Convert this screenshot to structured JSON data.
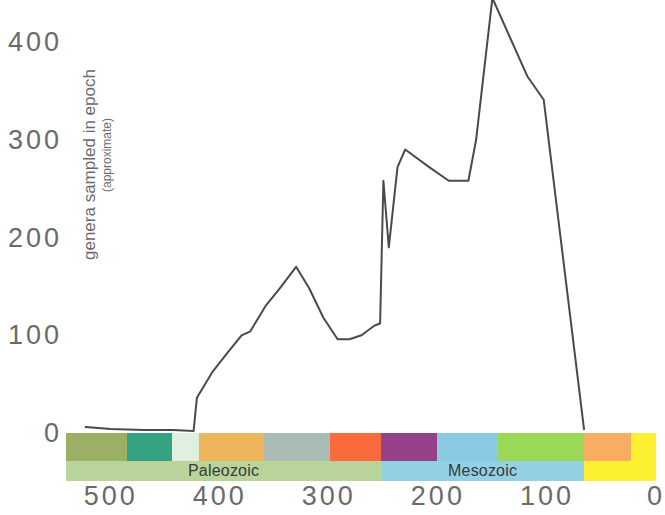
{
  "chart_data": {
    "type": "line",
    "title": "",
    "xlabel": "",
    "ylabel": "genera sampled in epoch",
    "ylabel_sub": "(approximate)",
    "xlim": [
      541,
      0
    ],
    "ylim": [
      0,
      460
    ],
    "x_reversed": true,
    "grid": false,
    "legend": null,
    "line_color": "#4a4a4a",
    "x_ticks": [
      {
        "value": 500,
        "label": "500"
      },
      {
        "value": 400,
        "label": "400"
      },
      {
        "value": 300,
        "label": "300"
      },
      {
        "value": 200,
        "label": "200"
      },
      {
        "value": 100,
        "label": "100"
      },
      {
        "value": 0,
        "label": "0"
      }
    ],
    "y_ticks": [
      {
        "value": 0,
        "label": "0"
      },
      {
        "value": 100,
        "label": "100"
      },
      {
        "value": 200,
        "label": "200"
      },
      {
        "value": 300,
        "label": "300"
      },
      {
        "value": 400,
        "label": "400"
      }
    ],
    "series": [
      {
        "name": "genera sampled in epoch",
        "points": [
          [
            523,
            6
          ],
          [
            500,
            4
          ],
          [
            470,
            3
          ],
          [
            443,
            3
          ],
          [
            424,
            2
          ],
          [
            421,
            36
          ],
          [
            407,
            62
          ],
          [
            393,
            82
          ],
          [
            380,
            100
          ],
          [
            372,
            104
          ],
          [
            358,
            130
          ],
          [
            345,
            148
          ],
          [
            330,
            170
          ],
          [
            318,
            148
          ],
          [
            305,
            118
          ],
          [
            292,
            96
          ],
          [
            281,
            96
          ],
          [
            270,
            100
          ],
          [
            258,
            110
          ],
          [
            253,
            112
          ],
          [
            250,
            258
          ],
          [
            245,
            190
          ],
          [
            237,
            272
          ],
          [
            230,
            290
          ],
          [
            208,
            272
          ],
          [
            190,
            258
          ],
          [
            172,
            258
          ],
          [
            165,
            300
          ],
          [
            150,
            445
          ],
          [
            118,
            365
          ],
          [
            103,
            341
          ],
          [
            66,
            4
          ]
        ]
      }
    ],
    "timescale": {
      "periods": [
        {
          "name": "Cambrian",
          "start": 541,
          "end": 485,
          "color": "#9bb065"
        },
        {
          "name": "Ordovician",
          "start": 485,
          "end": 444,
          "color": "#35a283"
        },
        {
          "name": "Silurian",
          "start": 444,
          "end": 419,
          "color": "#dff0e0"
        },
        {
          "name": "Devonian",
          "start": 419,
          "end": 359,
          "color": "#eeb45a"
        },
        {
          "name": "Carboniferous",
          "start": 359,
          "end": 299,
          "color": "#a9bcb4"
        },
        {
          "name": "Permian",
          "start": 299,
          "end": 252,
          "color": "#fa6a3c"
        },
        {
          "name": "Triassic",
          "start": 252,
          "end": 201,
          "color": "#96408a"
        },
        {
          "name": "Jurassic",
          "start": 201,
          "end": 145,
          "color": "#89cbe3"
        },
        {
          "name": "Cretaceous",
          "start": 145,
          "end": 66,
          "color": "#9ad958"
        },
        {
          "name": "Paleogene",
          "start": 66,
          "end": 23,
          "color": "#f8ad63"
        },
        {
          "name": "Neogene",
          "start": 23,
          "end": 0,
          "color": "#fdf030"
        }
      ],
      "eras": [
        {
          "name": "Paleozoic",
          "label": "Paleozoic",
          "start": 541,
          "end": 252,
          "color": "#b9d49a"
        },
        {
          "name": "Mesozoic",
          "label": "Mesozoic",
          "start": 252,
          "end": 66,
          "color": "#93d0e3"
        },
        {
          "name": "Cenozoic",
          "label": "",
          "start": 66,
          "end": 0,
          "color": "#fdf030"
        }
      ]
    }
  }
}
